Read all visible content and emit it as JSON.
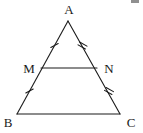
{
  "figure": {
    "kind": "geometry-diagram",
    "canvas": {
      "width": 143,
      "height": 133
    },
    "background_color": "#ffffff",
    "stroke_color": "#1a1a1a",
    "label_color": "#1a1a1a"
  },
  "points": {
    "A": {
      "label": "A",
      "x": 68,
      "y": 21,
      "label_x": 69,
      "label_y": 9
    },
    "B": {
      "label": "B",
      "x": 17,
      "y": 114,
      "label_x": 8,
      "label_y": 122
    },
    "C": {
      "label": "C",
      "x": 120,
      "y": 114,
      "label_x": 131,
      "label_y": 122
    },
    "M": {
      "label": "M",
      "x": 41,
      "y": 68,
      "label_x": 29,
      "label_y": 68
    },
    "N": {
      "label": "N",
      "x": 97,
      "y": 68,
      "label_x": 109,
      "label_y": 68
    }
  },
  "segments": [
    {
      "name": "AB",
      "from": "A",
      "to": "B",
      "x1": 68,
      "y1": 21,
      "x2": 17,
      "y2": 114
    },
    {
      "name": "AC",
      "from": "A",
      "to": "C",
      "x1": 68,
      "y1": 21,
      "x2": 120,
      "y2": 114
    },
    {
      "name": "BC",
      "from": "B",
      "to": "C",
      "x1": 17,
      "y1": 114,
      "x2": 120,
      "y2": 114
    },
    {
      "name": "MN",
      "from": "M",
      "to": "N",
      "x1": 41,
      "y1": 68,
      "x2": 97,
      "y2": 68
    }
  ],
  "tick_marks": [
    {
      "name": "tick-AM",
      "on_segment": "AM",
      "count": 1,
      "x": 54,
      "y": 45,
      "angle_deg": 61
    },
    {
      "name": "tick-MB",
      "on_segment": "MB",
      "count": 1,
      "x": 29,
      "y": 91,
      "angle_deg": 61
    },
    {
      "name": "tick-AN",
      "on_segment": "AN",
      "count": 2,
      "x": 82,
      "y": 45,
      "angle_deg": -61
    },
    {
      "name": "tick-NC",
      "on_segment": "NC",
      "count": 2,
      "x": 109,
      "y": 91,
      "angle_deg": -61
    }
  ],
  "artifact": {
    "name": "top-right-mark",
    "x": 131,
    "y": 0,
    "width": 8,
    "height": 3
  }
}
